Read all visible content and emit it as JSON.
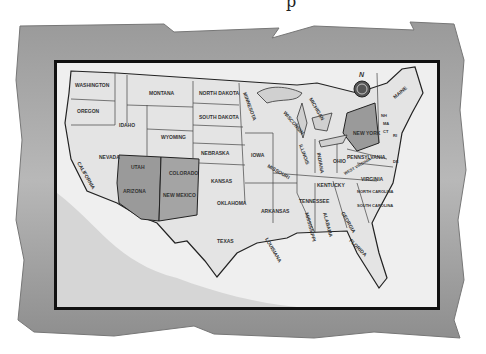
{
  "title_fragment": "p",
  "map": {
    "type": "United States outline map",
    "compass": {
      "label": "N"
    },
    "highlighted_states": [
      "Arizona",
      "New Mexico",
      "New York"
    ],
    "highlight_color": "#9a9a9a",
    "states": {
      "washington": "WASHINGTON",
      "oregon": "OREGON",
      "california": "CALIFORNIA",
      "idaho": "IDAHO",
      "nevada": "NEVADA",
      "montana": "MONTANA",
      "wyoming": "WYOMING",
      "utah": "UTAH",
      "colorado": "COLORADO",
      "arizona": "ARIZONA",
      "new_mexico": "NEW MEXICO",
      "north_dakota": "NORTH DAKOTA",
      "south_dakota": "SOUTH DAKOTA",
      "nebraska": "NEBRASKA",
      "kansas": "KANSAS",
      "oklahoma": "OKLAHOMA",
      "texas": "TEXAS",
      "minnesota": "MINNESOTA",
      "iowa": "IOWA",
      "missouri": "MISSOURI",
      "arkansas": "ARKANSAS",
      "louisiana": "LOUISIANA",
      "wisconsin": "WISCONSIN",
      "illinois": "ILLINOIS",
      "michigan": "MICHIGAN",
      "indiana": "INDIANA",
      "ohio": "OHIO",
      "kentucky": "KENTUCKY",
      "tennessee": "TENNESSEE",
      "mississippi": "MISSISSIPPI",
      "alabama": "ALABAMA",
      "georgia": "GEORGIA",
      "florida": "FLORIDA",
      "south_carolina": "SOUTH CAROLINA",
      "north_carolina": "NORTH CAROLINA",
      "virginia": "VIRGINIA",
      "west_virginia": "WEST VIRGINIA",
      "pennsylvania": "PENNSYLVANIA",
      "new_york": "NEW YORK",
      "maine": "MAINE",
      "delaware": "DE",
      "new_hampshire": "NH",
      "vermont": "VT",
      "massachusetts": "MA",
      "connecticut": "CT",
      "rhode_island": "RI"
    }
  }
}
